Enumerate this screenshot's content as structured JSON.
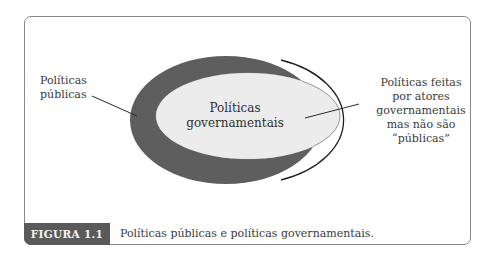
{
  "diagram": {
    "type": "venn-nested",
    "regions": [
      {
        "id": "public-policies",
        "label": "Políticas\npúblicas",
        "fill": "#5e5e5e"
      },
      {
        "id": "government-policies",
        "label": "Políticas governamentais",
        "fill": "#ececec"
      },
      {
        "id": "government-not-public",
        "label": "Políticas feitas por atores governamentais mas não são “públicas”",
        "fill": "#ececec"
      }
    ],
    "labels": {
      "left_line1": "Políticas",
      "left_line2": "públicas",
      "center_line1": "Políticas",
      "center_line2": "governamentais",
      "right_line1": "Políticas feitas",
      "right_line2": "por atores",
      "right_line3": "governamentais",
      "right_line4": "mas não são",
      "right_line5": "“públicas”"
    }
  },
  "caption": {
    "tag": "FIGURA 1.1",
    "text": "Políticas públicas e políticas governamentais."
  },
  "colors": {
    "outer_ellipse": "#5e5e5e",
    "inner_ellipse": "#ececec",
    "tag_background": "#5a5a5a",
    "frame_border": "#8a8a8a"
  }
}
